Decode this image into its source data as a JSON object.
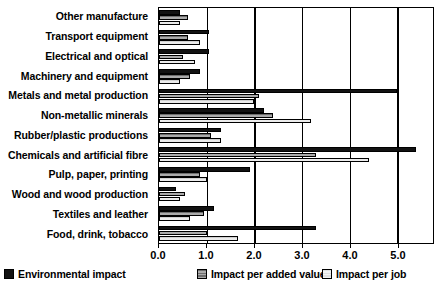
{
  "chart_data": {
    "type": "bar",
    "orientation": "horizontal",
    "title": "",
    "xlabel": "",
    "ylabel": "",
    "xlim": [
      0.0,
      5.75
    ],
    "grid": true,
    "legend_position": "bottom",
    "xticks": [
      "0.0",
      "1.0",
      "2.0",
      "3.0",
      "4.0",
      "5.0"
    ],
    "xtick_values": [
      0.0,
      1.0,
      2.0,
      3.0,
      4.0,
      5.0
    ],
    "categories": [
      "Other manufacture",
      "Transport equipment",
      "Electrical and optical",
      "Machinery and equipment",
      "Metals and metal production",
      "Non-metallic minerals",
      "Rubber/plastic productions",
      "Chemicals and artificial fibre",
      "Pulp, paper, printing",
      "Wood and wood production",
      "Textiles and leather",
      "Food, drink, tobacco"
    ],
    "series": [
      {
        "name": "Environmental impact",
        "color": "#121212",
        "values": [
          0.45,
          1.05,
          1.05,
          0.85,
          5.0,
          2.2,
          1.3,
          5.4,
          1.9,
          0.35,
          1.15,
          3.3
        ]
      },
      {
        "name": "Impact per added value",
        "color": "#6e6e6e",
        "values": [
          0.6,
          0.6,
          0.5,
          0.65,
          2.1,
          2.4,
          1.1,
          3.3,
          0.85,
          0.55,
          0.95,
          1.0
        ]
      },
      {
        "name": "Impact per job",
        "color": "#d0d0d0",
        "values": [
          0.45,
          0.85,
          0.75,
          0.45,
          2.0,
          3.2,
          1.3,
          4.4,
          1.0,
          0.45,
          0.65,
          1.65
        ]
      }
    ]
  }
}
